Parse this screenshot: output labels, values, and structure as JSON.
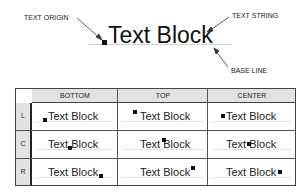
{
  "diagram": {
    "headline": {
      "text": "Text Block",
      "callouts": {
        "origin": "TEXT ORIGIN",
        "string": "TEXT STRING",
        "baseline": "BASE LINE"
      }
    },
    "table": {
      "columns": [
        "BOTTOM",
        "TOP",
        "CENTER"
      ],
      "rows": [
        {
          "label": "L",
          "cells": [
            "Text Block",
            "Text Block",
            "Text Block"
          ]
        },
        {
          "label": "C",
          "cells": [
            "Text Block",
            "Text Block",
            "Text Block"
          ]
        },
        {
          "label": "R",
          "cells": [
            "Text Block",
            "Text Block",
            "Text Block"
          ]
        }
      ]
    },
    "colors": {
      "header_fill": "#e2e2e2",
      "marker": "#111111",
      "text": "#1a1a1a"
    }
  }
}
